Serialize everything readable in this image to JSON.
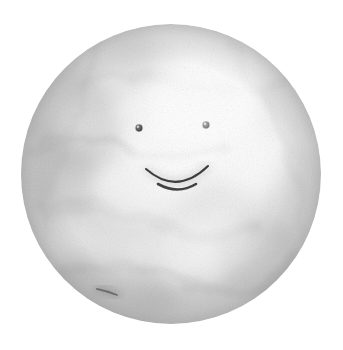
{
  "artwork": {
    "title": "Smiling Moon Face",
    "medium": "graphite pencil drawing",
    "background_color": "#ffffff",
    "canvas": {
      "width": 343,
      "height": 350
    },
    "subject": {
      "name": "moon-face",
      "shape": "circle",
      "center_x": 171,
      "center_y": 174,
      "radius": 150,
      "fill_base_color": "#f4f4f4",
      "texture": "mottled grainy cloud-like shading",
      "shading_note": "lightest at upper-right, darker mottled grey toward left and lower-right rim"
    },
    "features": {
      "left_eye": {
        "name": "left-eye",
        "center_x": 139,
        "center_y": 128,
        "radius": 3.4,
        "color": "#4a4a4a",
        "highlight_color": "#d8d8d8"
      },
      "right_eye": {
        "name": "right-eye",
        "center_x": 206,
        "center_y": 125,
        "radius": 3.4,
        "color": "#808080",
        "highlight_color": "#e4e4e4"
      },
      "mouth": {
        "name": "smile",
        "type": "arc",
        "left_x": 146,
        "left_y": 169,
        "right_x": 208,
        "right_y": 166,
        "bottom_x": 177,
        "bottom_y": 192,
        "stroke_color": "#3d3d3d",
        "stroke_width": 2.1
      }
    },
    "palette": {
      "paper": "#ffffff",
      "light_grey": "#f2f2f2",
      "mid_grey": "#d5d5d5",
      "shadow_grey": "#b4b4b4",
      "dark_accent": "#6e6e6e",
      "ink": "#3d3d3d"
    },
    "texture_blobs": [
      {
        "cx": 72,
        "cy": 120,
        "rx": 44,
        "ry": 58,
        "opacity": 0.3,
        "rot": -28
      },
      {
        "cx": 62,
        "cy": 186,
        "rx": 34,
        "ry": 44,
        "opacity": 0.26,
        "rot": 15
      },
      {
        "cx": 110,
        "cy": 72,
        "rx": 52,
        "ry": 30,
        "opacity": 0.22,
        "rot": -35
      },
      {
        "cx": 150,
        "cy": 60,
        "rx": 40,
        "ry": 26,
        "opacity": 0.18,
        "rot": 25
      },
      {
        "cx": 96,
        "cy": 232,
        "rx": 46,
        "ry": 34,
        "opacity": 0.2,
        "rot": -12
      },
      {
        "cx": 118,
        "cy": 286,
        "rx": 62,
        "ry": 28,
        "opacity": 0.3,
        "rot": 18
      },
      {
        "cx": 186,
        "cy": 300,
        "rx": 58,
        "ry": 24,
        "opacity": 0.22,
        "rot": -8
      },
      {
        "cx": 262,
        "cy": 262,
        "rx": 48,
        "ry": 40,
        "opacity": 0.3,
        "rot": 40
      },
      {
        "cx": 296,
        "cy": 196,
        "rx": 28,
        "ry": 52,
        "opacity": 0.26,
        "rot": 8
      },
      {
        "cx": 288,
        "cy": 108,
        "rx": 34,
        "ry": 38,
        "opacity": 0.2,
        "rot": -20
      },
      {
        "cx": 236,
        "cy": 214,
        "rx": 52,
        "ry": 30,
        "opacity": 0.16,
        "rot": 30
      },
      {
        "cx": 160,
        "cy": 236,
        "rx": 54,
        "ry": 26,
        "opacity": 0.14,
        "rot": -20
      },
      {
        "cx": 208,
        "cy": 82,
        "rx": 30,
        "ry": 26,
        "opacity": 0.12,
        "rot": 10
      },
      {
        "cx": 44,
        "cy": 160,
        "rx": 22,
        "ry": 40,
        "opacity": 0.22,
        "rot": -5
      }
    ],
    "dark_streak": {
      "name": "dark-streak",
      "x1": 96,
      "y1": 288,
      "x2": 118,
      "y2": 296,
      "color": "#5a5a5a"
    }
  }
}
